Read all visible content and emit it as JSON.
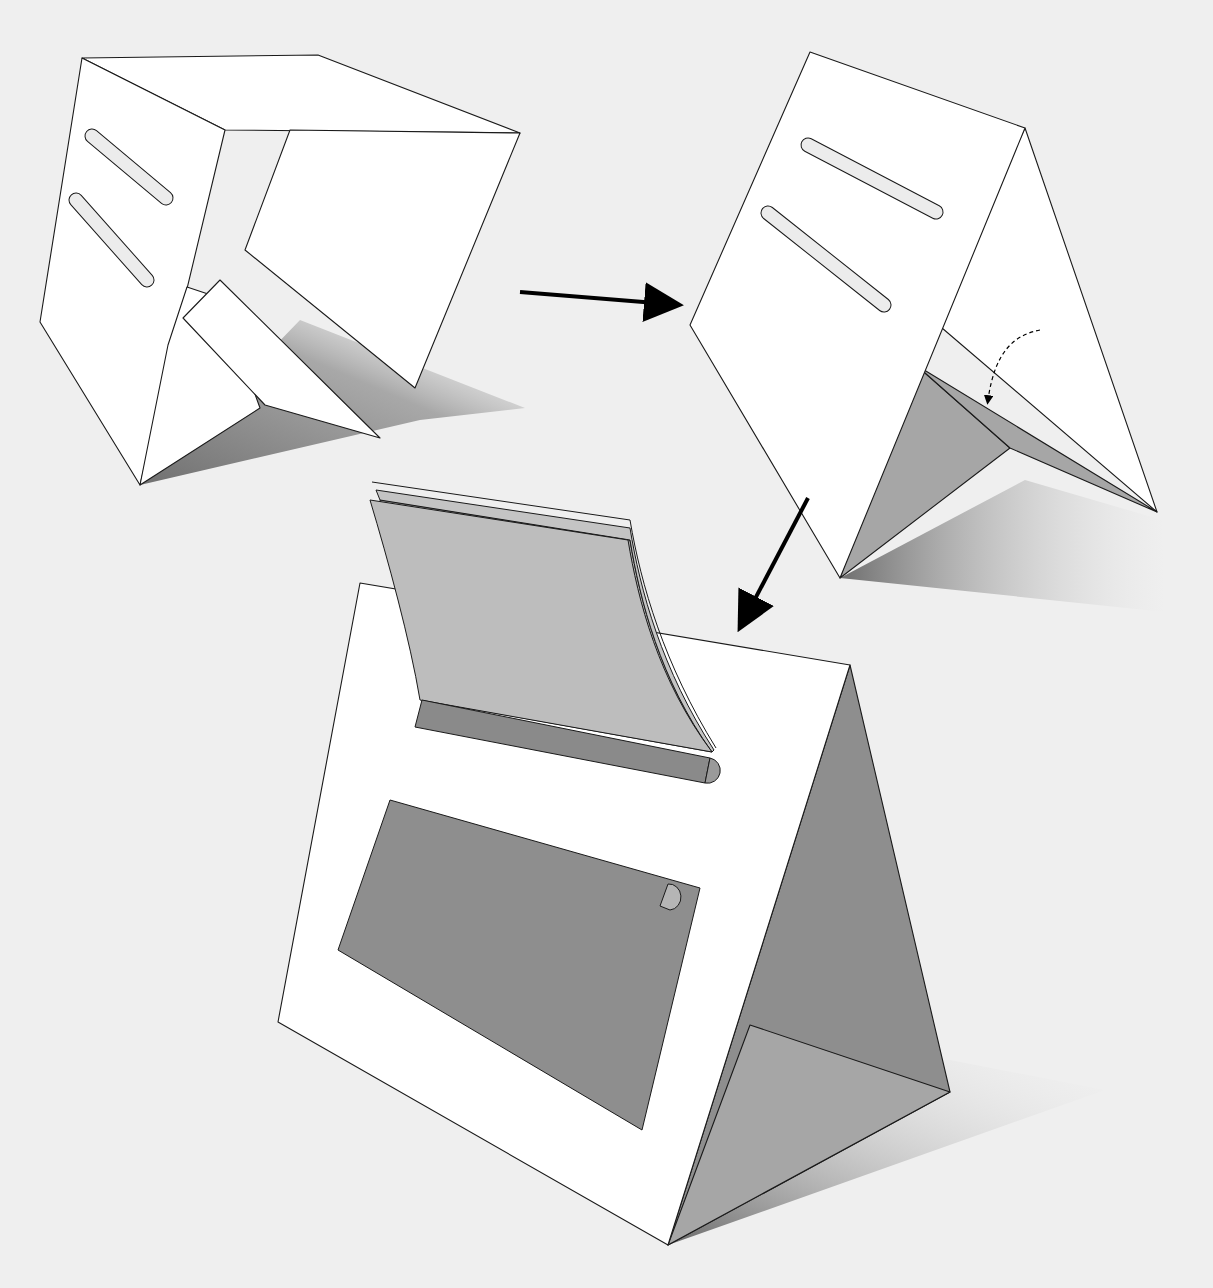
{
  "canvas": {
    "width": 1213,
    "height": 1288,
    "background": "#efefef"
  },
  "colors": {
    "paper": "#ffffff",
    "stroke": "#1a1a1a",
    "slot": "#ececec",
    "inner_gray": "#a6a6a6",
    "dark_gray": "#8e8e8e",
    "pad_gray": "#b8b8b8",
    "rod_gray": "#8a8a8a",
    "arrow": "#000000"
  },
  "steps": [
    {
      "id": "step-1-unfolded-stand",
      "shadow": "140,485 420,420 525,408 300,320 140,485",
      "panels": [
        {
          "name": "top-panel",
          "points": "82,58 318,55 520,133 225,130",
          "fill": "paper"
        },
        {
          "name": "front-panel",
          "points": "82,58 225,130 140,485 40,322",
          "fill": "paper"
        },
        {
          "name": "back-panel",
          "points": "290,130 520,133 415,388 245,250",
          "fill": "paper"
        },
        {
          "name": "inner-left-flap",
          "points": "187,287 220,298 260,408 140,485 168,345",
          "fill": "paper"
        },
        {
          "name": "inner-fold-flap",
          "points": "220,280 380,438 265,405 183,318",
          "fill": "paper"
        }
      ],
      "slots": [
        {
          "name": "upper-slot",
          "cx1": 92,
          "cy1": 136,
          "cx2": 166,
          "cy2": 198,
          "w": 13
        },
        {
          "name": "lower-slot",
          "cx1": 76,
          "cy1": 200,
          "cx2": 147,
          "cy2": 280,
          "w": 13
        }
      ]
    },
    {
      "id": "step-2-folded-tent",
      "shadow": "840,578 1165,612 1162,520 1025,480",
      "panels": [
        {
          "name": "right-panel",
          "points": "1025,128 1157,512 935,322",
          "fill": "paper"
        },
        {
          "name": "inner-floor-left",
          "points": "916,365 1010,448 840,578",
          "fill": "inner_gray"
        },
        {
          "name": "inner-floor-right",
          "points": "916,365 1157,512 1010,448",
          "fill": "inner_gray"
        },
        {
          "name": "front-panel",
          "points": "810,52 1025,128 840,578 690,325",
          "fill": "paper"
        }
      ],
      "slots": [
        {
          "name": "upper-slot",
          "cx1": 808,
          "cy1": 145,
          "cx2": 936,
          "cy2": 212,
          "w": 13
        },
        {
          "name": "lower-slot",
          "cx1": 768,
          "cy1": 213,
          "cx2": 884,
          "cy2": 305,
          "w": 13
        }
      ],
      "fold_hint_arrow": {
        "path": "M1040,330 C1015,335 995,350 988,400",
        "dashed": true
      }
    },
    {
      "id": "step-3-assembled-calendar",
      "shadow": "668,1245 1105,1090 950,1060 760,1060",
      "panels": [
        {
          "name": "side-panel",
          "points": "850,665 950,1092 668,1245",
          "fill": "dark_gray"
        },
        {
          "name": "side-inner",
          "points": "750,1025 950,1092 668,1245",
          "fill": "inner_gray"
        },
        {
          "name": "front-panel",
          "points": "360,583 850,665 668,1245 278,1022",
          "fill": "paper"
        }
      ],
      "calendar_pad": {
        "name": "calendar-pages",
        "fill": "pad_gray"
      },
      "binding_rod": {
        "name": "calendar-binding-rod",
        "points": "422,700 710,758 705,783 415,727"
      },
      "photo_panel": {
        "name": "photo-window",
        "points": "390,800 700,888 642,1130 338,950"
      }
    }
  ],
  "arrows": [
    {
      "name": "step-arrow-right",
      "x1": 520,
      "y1": 292,
      "x2": 668,
      "y2": 304
    },
    {
      "name": "step-arrow-down-left",
      "x1": 808,
      "y1": 498,
      "x2": 745,
      "y2": 618
    }
  ]
}
